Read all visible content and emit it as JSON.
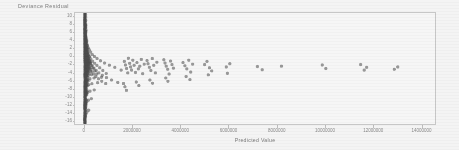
{
  "chart_data": {
    "type": "scatter",
    "title": "",
    "xlabel": "Predicted Value",
    "ylabel": "Deviance Residual",
    "xlim": [
      -400000,
      14600000
    ],
    "ylim": [
      -17,
      11
    ],
    "grid": false,
    "legend": null,
    "marker": {
      "color": "#3a3a3a",
      "size": 1.6,
      "opacity": 0.55
    },
    "xticks": [
      0,
      2000000,
      4000000,
      6000000,
      8000000,
      10000000,
      12000000,
      14000000
    ],
    "xticklabels": [
      "0",
      "2000000",
      "4000000",
      "6000000",
      "8000000",
      "10000000",
      "12000000",
      "14000000"
    ],
    "yticks": [
      10,
      8,
      6,
      4,
      2,
      0,
      -2,
      -4,
      -6,
      -8,
      -10,
      -12,
      -14,
      -16
    ],
    "yticklabels": [
      "10",
      "8",
      "6",
      "4",
      "2",
      "0",
      "-2",
      "-4",
      "-6",
      "-8",
      "-10",
      "-12",
      "-14",
      "-16"
    ],
    "points": [
      [
        9000,
        9.9
      ],
      [
        11000,
        9.2
      ],
      [
        14000,
        8.6
      ],
      [
        9000,
        8.1
      ],
      [
        17000,
        7.7
      ],
      [
        12000,
        7.4
      ],
      [
        8000,
        7.0
      ],
      [
        21000,
        6.8
      ],
      [
        15000,
        6.5
      ],
      [
        10000,
        6.3
      ],
      [
        26000,
        6.1
      ],
      [
        13000,
        5.9
      ],
      [
        9000,
        5.7
      ],
      [
        31000,
        5.5
      ],
      [
        18000,
        5.3
      ],
      [
        11000,
        5.1
      ],
      [
        40000,
        5.0
      ],
      [
        22000,
        4.8
      ],
      [
        14000,
        4.7
      ],
      [
        8000,
        4.5
      ],
      [
        52000,
        4.4
      ],
      [
        27000,
        4.2
      ],
      [
        17000,
        4.1
      ],
      [
        10000,
        3.9
      ],
      [
        66000,
        3.8
      ],
      [
        34000,
        3.7
      ],
      [
        21000,
        3.5
      ],
      [
        12000,
        3.4
      ],
      [
        88000,
        3.3
      ],
      [
        44000,
        3.1
      ],
      [
        26000,
        3.0
      ],
      [
        15000,
        2.9
      ],
      [
        115000,
        2.8
      ],
      [
        57000,
        2.7
      ],
      [
        33000,
        2.6
      ],
      [
        19000,
        2.4
      ],
      [
        9000,
        2.3
      ],
      [
        150000,
        2.2
      ],
      [
        74000,
        2.1
      ],
      [
        42000,
        2.0
      ],
      [
        24000,
        1.9
      ],
      [
        12000,
        1.8
      ],
      [
        195000,
        1.7
      ],
      [
        96000,
        1.6
      ],
      [
        54000,
        1.5
      ],
      [
        31000,
        1.4
      ],
      [
        16000,
        1.3
      ],
      [
        8000,
        1.2
      ],
      [
        250000,
        1.15
      ],
      [
        125000,
        1.05
      ],
      [
        70000,
        0.95
      ],
      [
        40000,
        0.85
      ],
      [
        22000,
        0.75
      ],
      [
        11000,
        0.65
      ],
      [
        5000,
        0.55
      ],
      [
        320000,
        0.5
      ],
      [
        160000,
        0.42
      ],
      [
        90000,
        0.35
      ],
      [
        51000,
        0.28
      ],
      [
        29000,
        0.2
      ],
      [
        14000,
        0.12
      ],
      [
        6000,
        0.05
      ],
      [
        410000,
        0.0
      ],
      [
        205000,
        -0.06
      ],
      [
        115000,
        -0.12
      ],
      [
        65000,
        -0.2
      ],
      [
        37000,
        -0.28
      ],
      [
        18000,
        -0.36
      ],
      [
        8000,
        -0.44
      ],
      [
        520000,
        -0.5
      ],
      [
        260000,
        -0.58
      ],
      [
        147000,
        -0.66
      ],
      [
        83000,
        -0.74
      ],
      [
        47000,
        -0.82
      ],
      [
        23000,
        -0.9
      ],
      [
        10000,
        -0.98
      ],
      [
        660000,
        -1.05
      ],
      [
        330000,
        -1.13
      ],
      [
        186000,
        -1.2
      ],
      [
        105000,
        -1.28
      ],
      [
        59000,
        -1.36
      ],
      [
        29000,
        -1.44
      ],
      [
        13000,
        -1.52
      ],
      [
        830000,
        -1.6
      ],
      [
        415000,
        -1.68
      ],
      [
        234000,
        -1.76
      ],
      [
        132000,
        -1.84
      ],
      [
        74000,
        -1.92
      ],
      [
        37000,
        -2.0
      ],
      [
        16000,
        -2.08
      ],
      [
        1030000,
        -2.15
      ],
      [
        515000,
        -2.23
      ],
      [
        290000,
        -2.31
      ],
      [
        163000,
        -2.39
      ],
      [
        92000,
        -2.47
      ],
      [
        46000,
        -2.55
      ],
      [
        20000,
        -2.63
      ],
      [
        1260000,
        -2.7
      ],
      [
        630000,
        -2.8
      ],
      [
        354000,
        -2.9
      ],
      [
        199000,
        -3.0
      ],
      [
        112000,
        -3.1
      ],
      [
        56000,
        -3.2
      ],
      [
        25000,
        -3.3
      ],
      [
        1520000,
        -3.4
      ],
      [
        760000,
        -3.5
      ],
      [
        427000,
        -3.6
      ],
      [
        240000,
        -3.7
      ],
      [
        135000,
        -3.8
      ],
      [
        67000,
        -3.9
      ],
      [
        30000,
        -4.0
      ],
      [
        1800000,
        -4.1
      ],
      [
        900000,
        -4.25
      ],
      [
        506000,
        -4.4
      ],
      [
        284000,
        -4.55
      ],
      [
        160000,
        -4.7
      ],
      [
        80000,
        -4.85
      ],
      [
        36000,
        -5.0
      ],
      [
        700000,
        -5.2
      ],
      [
        394000,
        -5.4
      ],
      [
        221000,
        -5.6
      ],
      [
        124000,
        -5.8
      ],
      [
        62000,
        -6.0
      ],
      [
        28000,
        -6.2
      ],
      [
        13000,
        -6.4
      ],
      [
        540000,
        -6.6
      ],
      [
        304000,
        -6.85
      ],
      [
        171000,
        -7.1
      ],
      [
        96000,
        -7.35
      ],
      [
        48000,
        -7.6
      ],
      [
        22000,
        -7.85
      ],
      [
        10000,
        -8.1
      ],
      [
        400000,
        -8.4
      ],
      [
        225000,
        -8.7
      ],
      [
        127000,
        -9.0
      ],
      [
        71000,
        -9.3
      ],
      [
        36000,
        -9.6
      ],
      [
        16000,
        -9.9
      ],
      [
        7000,
        -10.2
      ],
      [
        280000,
        -10.6
      ],
      [
        158000,
        -11.0
      ],
      [
        89000,
        -11.4
      ],
      [
        50000,
        -11.8
      ],
      [
        25000,
        -12.2
      ],
      [
        11000,
        -12.6
      ],
      [
        5000,
        -13.0
      ],
      [
        170000,
        -13.5
      ],
      [
        96000,
        -14.0
      ],
      [
        54000,
        -14.5
      ],
      [
        27000,
        -15.0
      ],
      [
        12000,
        -15.5
      ],
      [
        6000,
        -16.0
      ],
      [
        6000,
        9.4
      ],
      [
        8000,
        8.9
      ],
      [
        10000,
        8.3
      ],
      [
        7000,
        7.9
      ],
      [
        13000,
        7.2
      ],
      [
        9000,
        6.9
      ],
      [
        16000,
        6.6
      ],
      [
        11000,
        6.2
      ],
      [
        20000,
        5.8
      ],
      [
        13000,
        5.4
      ],
      [
        25000,
        5.2
      ],
      [
        16000,
        4.9
      ],
      [
        31000,
        4.6
      ],
      [
        20000,
        4.3
      ],
      [
        38000,
        4.0
      ],
      [
        24000,
        3.6
      ],
      [
        47000,
        3.2
      ],
      [
        30000,
        2.9
      ],
      [
        58000,
        2.5
      ],
      [
        37000,
        2.2
      ],
      [
        72000,
        1.9
      ],
      [
        46000,
        1.6
      ],
      [
        89000,
        1.3
      ],
      [
        57000,
        1.0
      ],
      [
        110000,
        0.7
      ],
      [
        70000,
        0.4
      ],
      [
        136000,
        0.1
      ],
      [
        87000,
        -0.2
      ],
      [
        168000,
        -0.5
      ],
      [
        107000,
        -0.8
      ],
      [
        207000,
        -1.1
      ],
      [
        132000,
        -1.4
      ],
      [
        256000,
        -1.7
      ],
      [
        163000,
        -2.0
      ],
      [
        316000,
        -2.3
      ],
      [
        201000,
        -2.6
      ],
      [
        390000,
        -2.9
      ],
      [
        248000,
        -3.2
      ],
      [
        482000,
        -3.5
      ],
      [
        307000,
        -3.8
      ],
      [
        595000,
        -4.1
      ],
      [
        379000,
        -4.4
      ],
      [
        735000,
        -4.7
      ],
      [
        468000,
        -5.0
      ],
      [
        908000,
        -5.3
      ],
      [
        578000,
        -5.6
      ],
      [
        1121000,
        -5.9
      ],
      [
        714000,
        -6.2
      ],
      [
        1384000,
        -6.5
      ],
      [
        881000,
        -6.8
      ],
      [
        1650000,
        -1.2
      ],
      [
        1700000,
        -2.1
      ],
      [
        1750000,
        -3.0
      ],
      [
        1820000,
        -0.4
      ],
      [
        1880000,
        -1.7
      ],
      [
        1920000,
        -2.6
      ],
      [
        1960000,
        -3.4
      ],
      [
        2010000,
        -0.9
      ],
      [
        2060000,
        -2.2
      ],
      [
        2120000,
        -4.0
      ],
      [
        2180000,
        -1.5
      ],
      [
        2240000,
        -3.1
      ],
      [
        2300000,
        -2.4
      ],
      [
        2360000,
        -0.7
      ],
      [
        2420000,
        -4.3
      ],
      [
        2480000,
        -1.9
      ],
      [
        2600000,
        -1.0
      ],
      [
        2640000,
        -1.8
      ],
      [
        2700000,
        -2.7
      ],
      [
        2760000,
        -3.5
      ],
      [
        2820000,
        -0.5
      ],
      [
        2880000,
        -2.2
      ],
      [
        2950000,
        -4.1
      ],
      [
        3010000,
        -1.4
      ],
      [
        3300000,
        -0.8
      ],
      [
        3350000,
        -1.6
      ],
      [
        3400000,
        -2.4
      ],
      [
        3460000,
        -3.2
      ],
      [
        3520000,
        -4.4
      ],
      [
        3580000,
        -1.1
      ],
      [
        3640000,
        -2.0
      ],
      [
        3700000,
        -2.9
      ],
      [
        4100000,
        -1.5
      ],
      [
        4180000,
        -2.3
      ],
      [
        4260000,
        -3.1
      ],
      [
        4340000,
        -0.9
      ],
      [
        4420000,
        -3.9
      ],
      [
        4500000,
        -1.9
      ],
      [
        5000000,
        -2.0
      ],
      [
        5100000,
        -1.2
      ],
      [
        5200000,
        -2.8
      ],
      [
        5300000,
        -3.6
      ],
      [
        5900000,
        -2.6
      ],
      [
        6050000,
        -1.8
      ],
      [
        7200000,
        -2.5
      ],
      [
        7400000,
        -3.3
      ],
      [
        8200000,
        -2.4
      ],
      [
        9900000,
        -2.1
      ],
      [
        10050000,
        -3.0
      ],
      [
        11500000,
        -2.0
      ],
      [
        11650000,
        -3.4
      ],
      [
        11750000,
        -2.7
      ],
      [
        12900000,
        -3.2
      ],
      [
        13050000,
        -2.6
      ],
      [
        1620000,
        -6.8
      ],
      [
        1680000,
        -7.6
      ],
      [
        1740000,
        -8.5
      ],
      [
        2150000,
        -6.4
      ],
      [
        2260000,
        -7.3
      ],
      [
        2720000,
        -5.9
      ],
      [
        2830000,
        -6.7
      ],
      [
        3380000,
        -5.4
      ],
      [
        3470000,
        -6.2
      ],
      [
        4230000,
        -5.0
      ],
      [
        4390000,
        -5.8
      ],
      [
        5150000,
        -4.6
      ],
      [
        5950000,
        -4.2
      ]
    ]
  },
  "axis": {
    "xlabel": "Predicted Value",
    "ylabel": "Deviance Residual"
  },
  "colors": {
    "marker": "#3a3a3a",
    "frame": "#c9c9c9",
    "text": "#6d6d6d",
    "background": "#ffffff"
  }
}
